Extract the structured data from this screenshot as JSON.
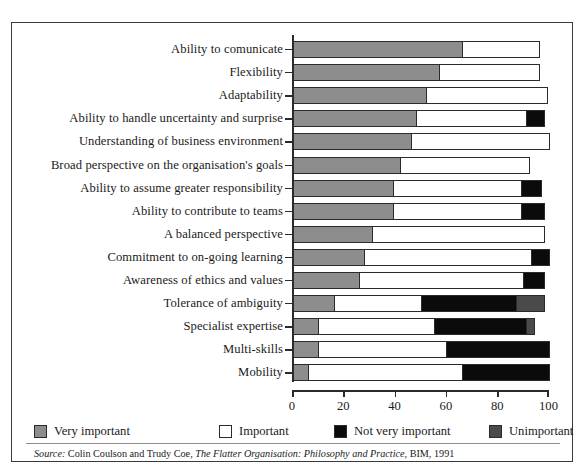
{
  "chart_data": {
    "type": "bar",
    "orientation": "horizontal",
    "stacked": true,
    "percent": true,
    "title": "",
    "xlabel": "",
    "ylabel": "",
    "xlim": [
      0,
      100
    ],
    "xticks": [
      0,
      20,
      40,
      60,
      80,
      100
    ],
    "xtick_labels": [
      "0",
      "20",
      "40",
      "60",
      "80",
      "100"
    ],
    "grid": false,
    "legend_position": "bottom-left",
    "categories": [
      "Ability to comunicate",
      "Flexibility",
      "Adaptability",
      "Ability to handle uncertainty and surprise",
      "Understanding of business environment",
      "Broad perspective on the organisation's goals",
      "Ability to assume greater responsibility",
      "Ability to contribute to teams",
      "A balanced perspective",
      "Commitment to on-going learning",
      "Awareness of ethics and values",
      "Tolerance of ambiguity",
      "Specialist expertise",
      "Multi-skills",
      "Mobility"
    ],
    "series": [
      {
        "name": "Very important",
        "color": "#8d8d8d",
        "values": [
          66,
          57,
          52,
          48,
          46,
          42,
          39,
          39,
          31,
          28,
          26,
          16,
          10,
          10,
          6
        ]
      },
      {
        "name": "Important",
        "color": "#ffffff",
        "values": [
          30,
          39,
          47,
          43,
          54,
          50,
          50,
          50,
          67,
          65,
          64,
          34,
          45,
          50,
          60
        ]
      },
      {
        "name": "Not very important",
        "color": "#0b0b0b",
        "values": [
          0,
          0,
          0,
          7,
          0,
          0,
          8,
          9,
          0,
          7,
          8,
          37,
          36,
          40,
          34
        ]
      },
      {
        "name": "Unimportant",
        "color": "#4a4a4a",
        "values": [
          0,
          0,
          0,
          0,
          0,
          0,
          0,
          0,
          0,
          0,
          0,
          11,
          3,
          0,
          0
        ]
      }
    ],
    "source": {
      "prefix": "Source:",
      "authors": "Colin Coulson and Trudy Coe,",
      "work": "The Flatter Organisation: Philosophy and Practice,",
      "publisher": "BIM, 1991"
    }
  }
}
